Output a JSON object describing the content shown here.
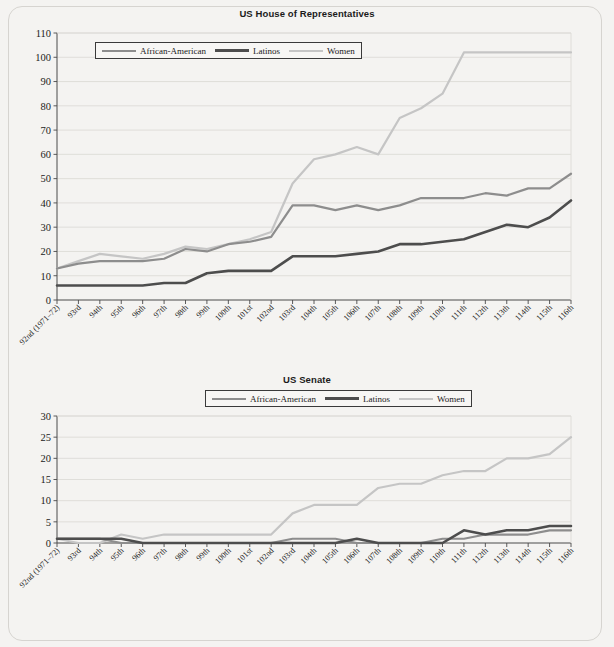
{
  "frame": {
    "background": "#f4f3f1",
    "border_color": "#d6d4d0"
  },
  "series_colors": {
    "african_american": "#8d8d8d",
    "latinos": "#4d4d4d",
    "women": "#c5c5c5"
  },
  "categories": [
    "92nd (1971–72)",
    "93rd",
    "94th",
    "95th",
    "96th",
    "97th",
    "98th",
    "99th",
    "100th",
    "101st",
    "102nd",
    "103rd",
    "104th",
    "105th",
    "106th",
    "107th",
    "108th",
    "109th",
    "110th",
    "111th",
    "112th",
    "113th",
    "114th",
    "115th",
    "116th"
  ],
  "legend": {
    "items": [
      {
        "label": "African-American",
        "color": "#8d8d8d",
        "width": 2.6
      },
      {
        "label": "Latinos",
        "color": "#4d4d4d",
        "width": 3.2
      },
      {
        "label": "Women",
        "color": "#c5c5c5",
        "width": 2.6
      }
    ]
  },
  "charts": [
    {
      "id": "house",
      "title": "US House of Representatives",
      "chart_data": {
        "type": "line",
        "title": "US House of Representatives",
        "xlabel": "",
        "ylabel": "",
        "ylim": [
          0,
          110
        ],
        "ytick_step": 10,
        "yticks": [
          0,
          10,
          20,
          30,
          40,
          50,
          60,
          70,
          80,
          90,
          100,
          110
        ],
        "grid": true,
        "legend_position": "inside-top",
        "categories": [
          "92nd (1971–72)",
          "93rd",
          "94th",
          "95th",
          "96th",
          "97th",
          "98th",
          "99th",
          "100th",
          "101st",
          "102nd",
          "103rd",
          "104th",
          "105th",
          "106th",
          "107th",
          "108th",
          "109th",
          "110th",
          "111th",
          "112th",
          "113th",
          "114th",
          "115th",
          "116th"
        ],
        "series": [
          {
            "name": "African-American",
            "color": "#8d8d8d",
            "values": [
              13,
              15,
              16,
              16,
              16,
              17,
              21,
              20,
              23,
              24,
              26,
              39,
              39,
              37,
              39,
              37,
              39,
              42,
              42,
              42,
              44,
              43,
              46,
              46,
              52
            ]
          },
          {
            "name": "Latinos",
            "color": "#4d4d4d",
            "values": [
              6,
              6,
              6,
              6,
              6,
              7,
              7,
              11,
              12,
              12,
              12,
              18,
              18,
              18,
              19,
              20,
              23,
              23,
              24,
              25,
              28,
              31,
              30,
              34,
              41
            ]
          },
          {
            "name": "Women",
            "color": "#c5c5c5",
            "values": [
              13,
              16,
              19,
              18,
              17,
              19,
              22,
              21,
              23,
              25,
              28,
              48,
              58,
              60,
              63,
              60,
              75,
              79,
              85,
              102,
              102,
              102,
              102,
              102,
              102
            ]
          }
        ]
      }
    },
    {
      "id": "senate",
      "title": "US Senate",
      "chart_data": {
        "type": "line",
        "title": "US Senate",
        "xlabel": "",
        "ylabel": "",
        "ylim": [
          0,
          30
        ],
        "ytick_step": 5,
        "yticks": [
          0,
          5,
          10,
          15,
          20,
          25,
          30
        ],
        "grid": true,
        "legend_position": "above",
        "categories": [
          "92nd (1971–72)",
          "93rd",
          "94th",
          "95th",
          "96th",
          "97th",
          "98th",
          "99th",
          "100th",
          "101st",
          "102nd",
          "103rd",
          "104th",
          "105th",
          "106th",
          "107th",
          "108th",
          "109th",
          "110th",
          "111th",
          "112th",
          "113th",
          "114th",
          "115th",
          "116th"
        ],
        "series": [
          {
            "name": "African-American",
            "color": "#8d8d8d",
            "values": [
              1,
              1,
              1,
              0,
              0,
              0,
              0,
              0,
              0,
              0,
              0,
              1,
              1,
              1,
              0,
              0,
              0,
              0,
              1,
              1,
              2,
              2,
              2,
              3,
              3
            ]
          },
          {
            "name": "Latinos",
            "color": "#4d4d4d",
            "values": [
              1,
              1,
              1,
              1,
              0,
              0,
              0,
              0,
              0,
              0,
              0,
              0,
              0,
              0,
              1,
              0,
              0,
              0,
              0,
              3,
              2,
              3,
              3,
              4,
              4
            ]
          },
          {
            "name": "Women",
            "color": "#c5c5c5",
            "values": [
              1,
              0,
              0,
              2,
              1,
              2,
              2,
              2,
              2,
              2,
              2,
              7,
              9,
              9,
              9,
              13,
              14,
              14,
              16,
              17,
              17,
              20,
              20,
              21,
              25
            ]
          }
        ]
      }
    }
  ]
}
